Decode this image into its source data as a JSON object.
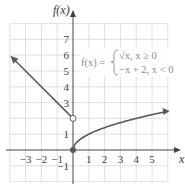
{
  "chart_data": {
    "type": "line",
    "title": "",
    "xlabel": "x",
    "ylabel": "f(x)",
    "xlim": [
      -4,
      6
    ],
    "ylim": [
      -2,
      8
    ],
    "grid": true,
    "x_ticks": [
      "-3",
      "-2",
      "-1",
      "1",
      "2",
      "3",
      "4",
      "5"
    ],
    "y_ticks": [
      "-1",
      "1",
      "3",
      "4",
      "5",
      "6",
      "7"
    ],
    "annotation": {
      "lhs": "f(x) =",
      "case1": "√x, x ≥ 0",
      "case2": "−x + 2, x < 0"
    },
    "series": [
      {
        "name": "-x + 2, x < 0",
        "x": [
          -3.9,
          -3,
          -2,
          -1,
          0
        ],
        "y": [
          5.9,
          5,
          4,
          3,
          2
        ],
        "end_open_circle": [
          0,
          2
        ],
        "arrow_at_start": true
      },
      {
        "name": "sqrt(x), x >= 0",
        "x": [
          0,
          0.25,
          1,
          2,
          3,
          4,
          5,
          5.8
        ],
        "y": [
          0,
          0.5,
          1,
          1.414,
          1.732,
          2,
          2.236,
          2.408
        ],
        "start_closed_circle": [
          0,
          0
        ],
        "arrow_at_end": true
      }
    ],
    "colors": {
      "curve": "#5a5a5a",
      "grid": "#d8d8d8",
      "axis": "#444444",
      "formula": "#8a8a8a"
    }
  }
}
